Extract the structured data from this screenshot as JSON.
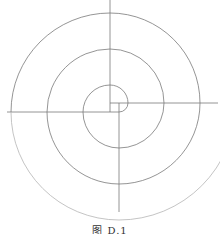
{
  "figure": {
    "caption": "图 D.1",
    "stroke_color": "#7a7a7a",
    "square": {
      "x1": 110,
      "y1": 103,
      "x2": 119,
      "y2": 112
    },
    "axes": [
      {
        "name": "up",
        "x1": 110,
        "y1": 0,
        "x2": 110,
        "y2": 112
      },
      {
        "name": "right",
        "x1": 110,
        "y1": 103,
        "x2": 218,
        "y2": 103
      },
      {
        "name": "down",
        "x1": 119,
        "y1": 103,
        "x2": 119,
        "y2": 212
      },
      {
        "name": "left",
        "x1": 7,
        "y1": 112,
        "x2": 119,
        "y2": 112
      }
    ],
    "spiral_step": 9,
    "spiral_quarters": 13
  }
}
